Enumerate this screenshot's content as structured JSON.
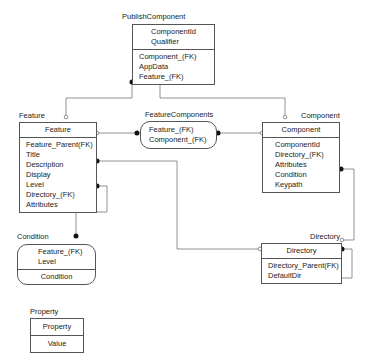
{
  "entities": {
    "publish_component": {
      "label": "PublishComponent",
      "keys": [
        "ComponentId",
        "Qualifier"
      ],
      "fields": [
        "Component_(FK)",
        "AppData",
        "Feature_(FK)"
      ]
    },
    "feature": {
      "label": "Feature",
      "header": "Feature",
      "fields": [
        "Feature_Parent(FK)",
        "Title",
        "Description",
        "Display",
        "Level",
        "Directory_(FK)",
        "Attributes"
      ]
    },
    "feature_components": {
      "label": "FeatureComponents",
      "fields": [
        "Feature_(FK)",
        "Component_(FK)"
      ]
    },
    "component": {
      "label": "Component",
      "header": "Component",
      "fields": [
        "ComponentId",
        "Directory_(FK)",
        "Attributes",
        "Condition",
        "Keypath"
      ]
    },
    "condition": {
      "label": "Condition",
      "keys": [
        "Feature_(FK)",
        "Level"
      ],
      "fields": [
        "Condition"
      ]
    },
    "directory": {
      "label": "Directory",
      "header": "Directory",
      "fields": [
        "Directory_Parent(FK)",
        "DefaultDir"
      ]
    },
    "property": {
      "label": "Property",
      "header": "Property",
      "fields": [
        "Value"
      ]
    }
  },
  "colors": {
    "line": "#777777",
    "border": "#555555",
    "dot": "#111111"
  }
}
